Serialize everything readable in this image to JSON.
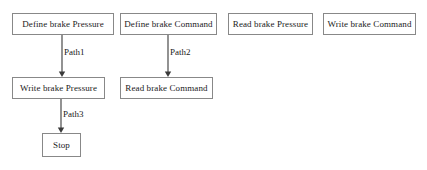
{
  "diagram": {
    "background_color": "#ffffff",
    "node_fill": "#ffffff",
    "node_border_color": "#888888",
    "text_color": "#1a1a1a",
    "edge_color": "#3a3a3a",
    "nodes": [
      {
        "id": "define-brake-pressure",
        "label": "Define brake Pressure",
        "x": 12,
        "y": 13,
        "w": 102,
        "h": 22
      },
      {
        "id": "define-brake-command",
        "label": "Define brake Command",
        "x": 120,
        "y": 13,
        "w": 97,
        "h": 22
      },
      {
        "id": "read-brake-pressure",
        "label": "Read brake Pressure",
        "x": 228,
        "y": 13,
        "w": 85,
        "h": 22
      },
      {
        "id": "write-brake-command",
        "label": "Write brake Command",
        "x": 323,
        "y": 13,
        "w": 93,
        "h": 22
      },
      {
        "id": "write-brake-pressure",
        "label": "Write brake Pressure",
        "x": 12,
        "y": 77,
        "w": 93,
        "h": 22
      },
      {
        "id": "read-brake-command",
        "label": "Read brake Command",
        "x": 120,
        "y": 77,
        "w": 93,
        "h": 22
      },
      {
        "id": "stop",
        "label": "Stop",
        "x": 42,
        "y": 133,
        "w": 39,
        "h": 24
      }
    ],
    "edges": [
      {
        "id": "path1",
        "label": "Path1",
        "from": "define-brake-pressure",
        "to": "write-brake-pressure",
        "x1": 62,
        "y1": 35,
        "x2": 62,
        "y2": 77,
        "label_x": 64,
        "label_y": 48
      },
      {
        "id": "path2",
        "label": "Path2",
        "from": "define-brake-command",
        "to": "read-brake-command",
        "x1": 168,
        "y1": 35,
        "x2": 168,
        "y2": 77,
        "label_x": 170,
        "label_y": 48
      },
      {
        "id": "path3",
        "label": "Path3",
        "from": "write-brake-pressure",
        "to": "stop",
        "x1": 61,
        "y1": 99,
        "x2": 61,
        "y2": 133,
        "label_x": 63,
        "label_y": 110
      }
    ]
  }
}
